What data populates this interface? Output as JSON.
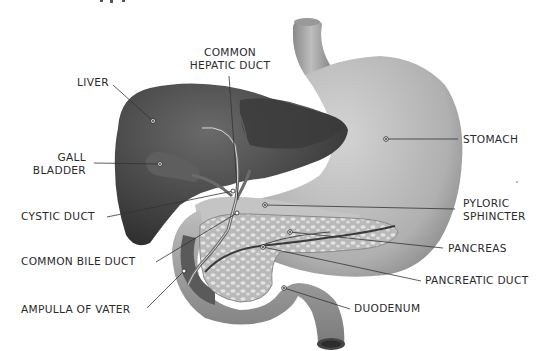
{
  "diagram": {
    "labels": {
      "common_hepatic_duct_1": "COMMON",
      "common_hepatic_duct_2": "HEPATIC DUCT",
      "liver": "LIVER",
      "gall_bladder_1": "GALL",
      "gall_bladder_2": "BLADDER",
      "cystic_duct": "CYSTIC DUCT",
      "common_bile_duct": "COMMON BILE DUCT",
      "ampulla_of_vater": "AMPULLA OF VATER",
      "stomach": "STOMACH",
      "pyloric_sphincter_1": "PYLORIC",
      "pyloric_sphincter_2": "SPHINCTER",
      "pancreas": "PANCREAS",
      "pancreatic_duct": "PANCREATIC DUCT",
      "duodenum": "DUODENUM"
    },
    "colors": {
      "background": "#ffffff",
      "text": "#2a2a2a",
      "leader": "#333333",
      "liver": "#4a4a4a",
      "stomach": "#b8b8b8",
      "pancreas": "#c9c9c9",
      "duodenum": "#9a9a9a"
    }
  }
}
